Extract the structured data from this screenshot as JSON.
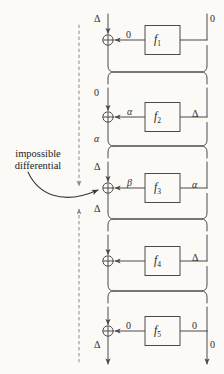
{
  "figure": {
    "annotation": {
      "line1": "impossible",
      "line2": "differential"
    },
    "colors": {
      "line": "#4a4a4a",
      "text": "#2c2c2c",
      "dashed": "#8a8a8a",
      "background": "#fbfaf7"
    },
    "geometry": {
      "left_rail_x": 108,
      "right_rail_x": 207,
      "dashed_x": 79,
      "box_left": 145,
      "box_right": 180
    }
  },
  "rounds": [
    {
      "function": "f",
      "index": "1",
      "xor_y": 40,
      "top_left_label": "Δ",
      "top_right_label": "0",
      "feed_label": "0",
      "right_label": "",
      "bottom_left_label": ""
    },
    {
      "function": "f",
      "index": "2",
      "xor_y": 117,
      "top_left_label": "0",
      "top_right_label": "",
      "feed_label": "α",
      "right_label": "Δ",
      "bottom_left_label": "α"
    },
    {
      "function": "f",
      "index": "3",
      "xor_y": 188,
      "top_left_label": "Δ",
      "top_right_label": "",
      "feed_label": "β",
      "right_label": "α",
      "bottom_left_label": "Δ"
    },
    {
      "function": "f",
      "index": "4",
      "xor_y": 261,
      "top_left_label": "",
      "top_right_label": "",
      "feed_label": "",
      "right_label": "Δ",
      "bottom_left_label": ""
    },
    {
      "function": "f",
      "index": "5",
      "xor_y": 331,
      "top_left_label": "",
      "top_right_label": "",
      "feed_label": "0",
      "right_label": "0",
      "bottom_left_label": "Δ"
    }
  ],
  "output": {
    "left_label": "Δ",
    "right_label": "0"
  },
  "dashed_guides": [
    {
      "name": "upper-guide",
      "x": 79,
      "y_start": 25,
      "y_end": 190,
      "arrow": "down"
    },
    {
      "name": "lower-guide",
      "x": 79,
      "y_start": 205,
      "y_end": 362,
      "arrow": "up"
    }
  ]
}
